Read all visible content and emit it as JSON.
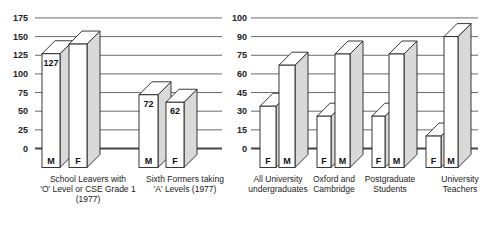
{
  "chart_data": [
    {
      "type": "bar",
      "title": "",
      "xlabel": "",
      "ylabel": "",
      "ylim": [
        0,
        175
      ],
      "yticks": [
        0,
        25,
        50,
        75,
        100,
        125,
        150,
        175
      ],
      "grid": true,
      "style": "3d-bars",
      "categories": [
        [
          "School Leavers with",
          "'O' Level or CSE Grade 1",
          "(1977)"
        ],
        [
          "Sixth Formers taking",
          "'A' Levels (1977)"
        ]
      ],
      "series": [
        {
          "name": "M",
          "values": [
            127,
            72
          ]
        },
        {
          "name": "F",
          "values": [
            140,
            62
          ]
        }
      ],
      "bar_order": [
        "M",
        "F"
      ],
      "value_labels": {
        "M": [
          "127",
          "72"
        ],
        "F": [
          "",
          "62"
        ]
      }
    },
    {
      "type": "bar",
      "title": "",
      "xlabel": "",
      "ylabel": "",
      "ylim": [
        0,
        100
      ],
      "yticks": [
        0,
        15,
        30,
        45,
        60,
        75,
        90,
        100
      ],
      "grid": true,
      "style": "3d-bars",
      "categories": [
        [
          "All University",
          "undergraduates"
        ],
        [
          "Oxford and",
          "Cambridge"
        ],
        [
          "Postgraduate",
          "Students"
        ],
        [
          "University",
          "Teachers"
        ]
      ],
      "series": [
        {
          "name": "F",
          "values": [
            34,
            26,
            26,
            10
          ]
        },
        {
          "name": "M",
          "values": [
            67,
            76,
            76,
            90
          ]
        }
      ],
      "bar_order": [
        "F",
        "M"
      ]
    }
  ],
  "colors": {
    "bar_front": "#ffffff",
    "bar_side": "#d9d9d9",
    "bar_top": "#ffffff",
    "outline": "#222222",
    "grid": "#444444"
  }
}
